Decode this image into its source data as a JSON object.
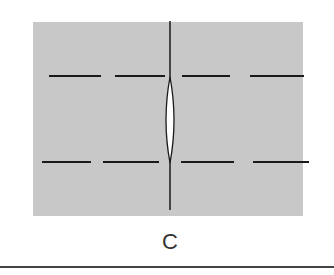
{
  "figure": {
    "panel_label": "C",
    "background_color": "#ffffff",
    "panel_fill": "#c8c8c8",
    "stroke_color": "#1a1a1a",
    "slit_fill": "#ffffff",
    "rule_color": "#444444"
  },
  "diagram": {
    "panel": {
      "x": 33,
      "y": 22,
      "width": 270,
      "height": 194
    },
    "vertical_line": {
      "x": 170,
      "y1": 21,
      "y2": 210
    },
    "slit": {
      "cx": 170,
      "y_top": 77,
      "y_bottom": 163,
      "half_width": 4
    },
    "dash_rows": [
      {
        "y": 76,
        "dashes": [
          [
            49,
            101
          ],
          [
            115,
            165
          ],
          [
            182,
            230
          ],
          [
            250,
            304
          ]
        ]
      },
      {
        "y": 162,
        "dashes": [
          [
            42,
            91
          ],
          [
            103,
            159
          ],
          [
            181,
            234
          ],
          [
            253,
            309
          ]
        ]
      }
    ]
  }
}
